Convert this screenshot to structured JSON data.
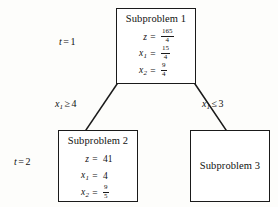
{
  "figure": {
    "type": "branch-and-bound-tree",
    "stage_labels": [
      {
        "id": "t1",
        "variable": "t",
        "equals": "=",
        "value": "1"
      },
      {
        "id": "t2",
        "variable": "t",
        "equals": "=",
        "value": "2"
      }
    ],
    "branch_labels": [
      {
        "id": "left",
        "variable": "x",
        "subscript": "1",
        "operator": "≥",
        "value": "4"
      },
      {
        "id": "right",
        "variable": "x",
        "subscript": "1",
        "operator": "≤",
        "value": "3"
      }
    ],
    "nodes": [
      {
        "id": "sub1",
        "title": "Subproblem 1",
        "equations": [
          {
            "lhs": "z",
            "sub": "",
            "eq": "=",
            "numerator": "165",
            "denominator": "4",
            "display": "fraction"
          },
          {
            "lhs": "x",
            "sub": "1",
            "eq": "=",
            "numerator": "15",
            "denominator": "4",
            "display": "fraction"
          },
          {
            "lhs": "x",
            "sub": "2",
            "eq": "=",
            "numerator": "9",
            "denominator": "4",
            "display": "fraction"
          }
        ]
      },
      {
        "id": "sub2",
        "title": "Subproblem 2",
        "equations": [
          {
            "lhs": "z",
            "sub": "",
            "eq": "=",
            "value": "41",
            "display": "integer"
          },
          {
            "lhs": "x",
            "sub": "1",
            "eq": "=",
            "value": "4",
            "display": "integer"
          },
          {
            "lhs": "x",
            "sub": "2",
            "eq": "=",
            "numerator": "9",
            "denominator": "5",
            "display": "fraction"
          }
        ]
      },
      {
        "id": "sub3",
        "title": "Subproblem 3",
        "equations": []
      }
    ],
    "colors": {
      "stroke": "#1a1a1a",
      "background": "#fdfdfb",
      "node_fill": "#ffffff",
      "text": "#111111"
    }
  }
}
